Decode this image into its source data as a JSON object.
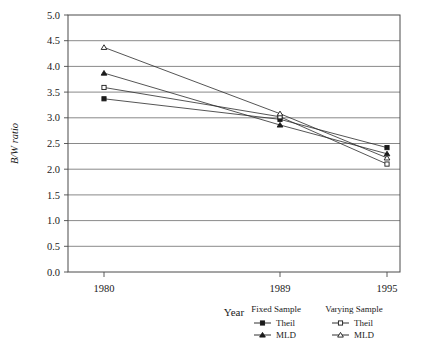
{
  "chart_data": {
    "type": "line",
    "title": "",
    "xlabel": "Year",
    "ylabel": "B/W ratio",
    "x": [
      1980,
      1989,
      1995
    ],
    "xticklabels": [
      "1980",
      "1989",
      "1995"
    ],
    "ylim": [
      0.0,
      5.0
    ],
    "yticks": [
      0.0,
      0.5,
      1.0,
      1.5,
      2.0,
      2.5,
      3.0,
      3.5,
      4.0,
      4.5,
      5.0
    ],
    "yticklabels": [
      "0.0",
      "0.5",
      "1.0",
      "1.5",
      "2.0",
      "2.5",
      "3.0",
      "3.5",
      "4.0",
      "4.5",
      "5.0"
    ],
    "grid": "horizontal",
    "legend_position": "below-right",
    "series": [
      {
        "name": "Theil",
        "group": "Fixed Sample",
        "marker": "filled-square",
        "values": [
          3.37,
          2.97,
          2.42
        ]
      },
      {
        "name": "MLD",
        "group": "Fixed Sample",
        "marker": "filled-triangle",
        "values": [
          3.87,
          2.86,
          2.3
        ]
      },
      {
        "name": "Theil",
        "group": "Varying Sample",
        "marker": "open-square",
        "values": [
          3.59,
          3.02,
          2.1
        ]
      },
      {
        "name": "MLD",
        "group": "Varying Sample",
        "marker": "open-triangle",
        "values": [
          4.37,
          3.08,
          2.22
        ]
      }
    ]
  },
  "legend": {
    "groups": [
      {
        "header": "Fixed Sample",
        "entries": [
          {
            "label": "Theil",
            "marker": "filled-square"
          },
          {
            "label": "MLD",
            "marker": "filled-triangle"
          }
        ]
      },
      {
        "header": "Varying Sample",
        "entries": [
          {
            "label": "Theil",
            "marker": "open-square"
          },
          {
            "label": "MLD",
            "marker": "open-triangle"
          }
        ]
      }
    ]
  }
}
